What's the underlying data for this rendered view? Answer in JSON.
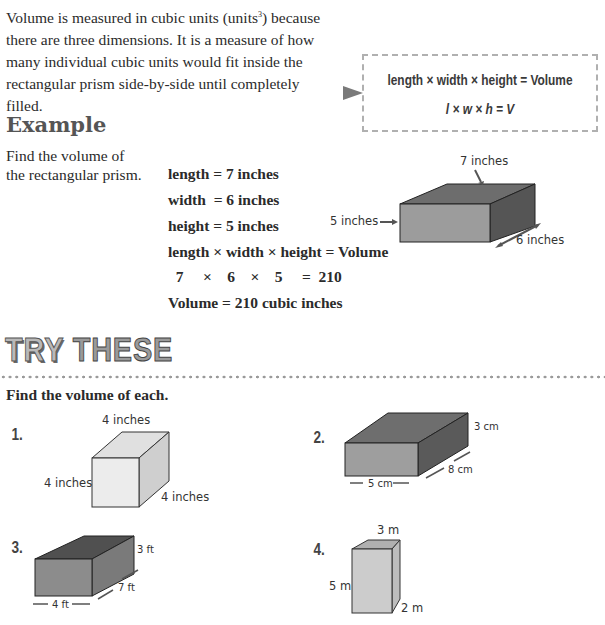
{
  "intro": {
    "text_before_sup": "Volume is measured in cubic units (units",
    "sup": "3",
    "text_after_sup": ") because there are three dimensions. It is a measure of how many individual cubic units would fit inside the rectangular prism side-by-side until completely filled."
  },
  "formula": {
    "words": "length × width × height = Volume",
    "symbols": "l × w × h = V"
  },
  "example": {
    "heading": "Example",
    "prompt": "Find the volume of the rectangular prism.",
    "lines": [
      "length = 7 inches",
      "width  = 6 inches",
      "height = 5 inches",
      "length × width × height = Volume",
      "  7     ×    6    ×    5     =  210",
      "Volume = 210 cubic inches"
    ],
    "figure": {
      "length_label": "7 inches",
      "height_label": "5 inches",
      "width_label": "6 inches"
    }
  },
  "try_these": {
    "title_part1": "TRY",
    "title_part2": "THESE",
    "instructions": "Find the volume of each.",
    "problems": [
      {
        "number": "1.",
        "top": "4 inches",
        "left": "4 inches",
        "right": "4 inches"
      },
      {
        "number": "2.",
        "height": "3 cm",
        "depth": "8 cm",
        "length": "5 cm"
      },
      {
        "number": "3.",
        "height": "3 ft",
        "depth": "7 ft",
        "length": "4 ft"
      },
      {
        "number": "4.",
        "top": "3 m",
        "left": "5 m",
        "depth": "2 m"
      }
    ]
  }
}
